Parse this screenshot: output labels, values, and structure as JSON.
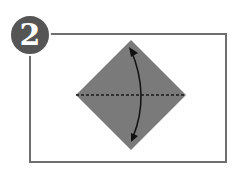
{
  "step": {
    "number": "2"
  },
  "colors": {
    "frame": "#6e6e6e",
    "badge": "#555555",
    "paper": "#7a7a7a",
    "fold_line": "#1a1a1a",
    "arrow": "#111111"
  },
  "diagram": {
    "shape": "square-diamond",
    "fold": "horizontal valley fold along diagonal",
    "arrow": "curved double-headed arrow (fold top down / unfold)"
  }
}
